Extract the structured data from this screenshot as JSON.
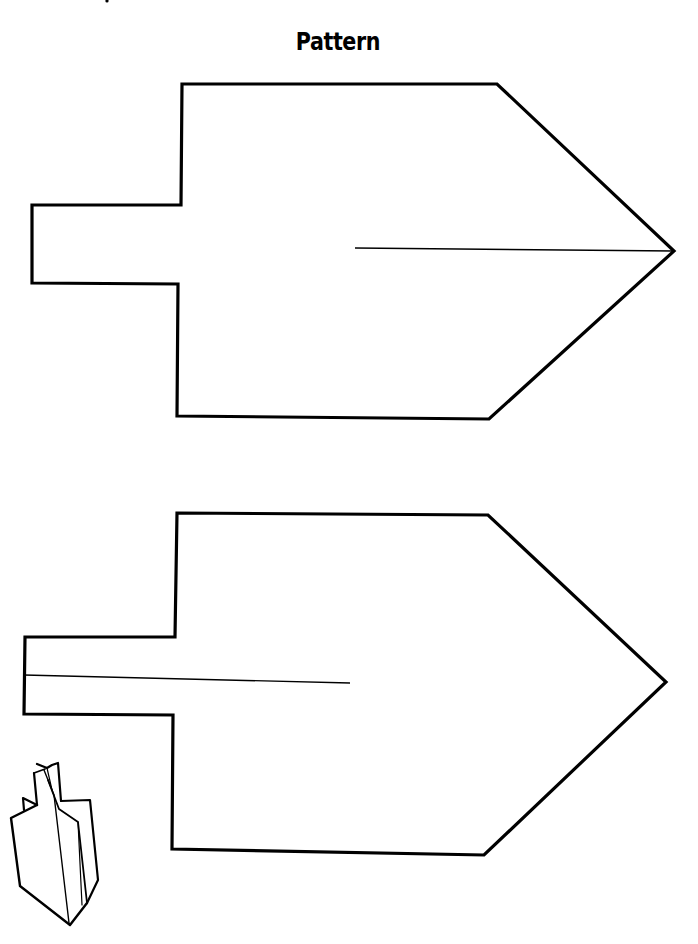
{
  "page": {
    "title": "Pattern",
    "colors": {
      "background": "#ffffff",
      "ink": "#000000"
    }
  },
  "pieces": [
    {
      "name": "top-piece",
      "outline": "182,84 497,84 674,251 489,419 177,416 178,284 32,283 32,205 181,205",
      "slit": {
        "x1": 355,
        "y1": 248,
        "x2": 674,
        "y2": 251,
        "from": "tip"
      }
    },
    {
      "name": "bottom-piece",
      "outline": "177,513 488,515 666,682 484,855 172,849 173,715 24,714 25,637 175,637",
      "slit": {
        "x1": 24,
        "y1": 675,
        "x2": 350,
        "y2": 683,
        "from": "tab"
      }
    }
  ],
  "illustration": {
    "icon": "assembled-dreidel-icon"
  }
}
